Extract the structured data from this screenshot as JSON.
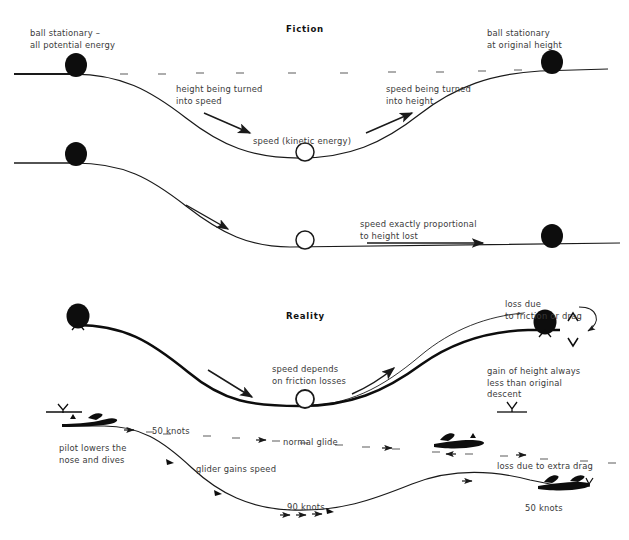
{
  "figure": {
    "type": "diagram"
  },
  "panels": [
    {
      "id": "fiction",
      "title": "Fiction",
      "title_pos": {
        "x": 286,
        "y": 24
      },
      "labels": [
        {
          "name": "ball-stationary-start",
          "text": "ball stationary –\nall potential energy",
          "x": 30,
          "y": 28
        },
        {
          "name": "height-into-speed",
          "text": "height being turned\ninto speed",
          "x": 176,
          "y": 84
        },
        {
          "name": "speed-kinetic-energy",
          "text": "speed (kinetic energy)",
          "x": 253,
          "y": 136
        },
        {
          "name": "speed-into-height",
          "text": "speed being turned\ninto height",
          "x": 386,
          "y": 84
        },
        {
          "name": "ball-stationary-end",
          "text": "ball stationary\nat original height",
          "x": 487,
          "y": 28
        },
        {
          "name": "speed-exactly-proportional",
          "text": "speed exactly proportional\nto height lost",
          "x": 360,
          "y": 219
        }
      ]
    },
    {
      "id": "reality",
      "title": "Reality",
      "title_pos": {
        "x": 286,
        "y": 311
      },
      "labels": [
        {
          "name": "speed-depends-friction",
          "text": "speed depends\non friction losses",
          "x": 272,
          "y": 364
        },
        {
          "name": "loss-due-friction-drag",
          "text": "loss due\nto friction or drag",
          "x": 505,
          "y": 299
        },
        {
          "name": "gain-of-height",
          "text": "gain of height always\nless than original\ndescent",
          "x": 487,
          "y": 366
        },
        {
          "name": "pilot-lowers-nose",
          "text": "pilot lowers the\nnose and dives",
          "x": 59,
          "y": 443
        },
        {
          "name": "glider-gains-speed",
          "text": "glider gains speed",
          "x": 196,
          "y": 464
        },
        {
          "name": "loss-due-extra-drag",
          "text": "loss due to extra drag",
          "x": 497,
          "y": 461
        }
      ],
      "speed_labels": [
        {
          "name": "speed-50-knots-top",
          "text": "50 knots",
          "x": 152,
          "y": 426
        },
        {
          "name": "normal-glide",
          "text": "normal glide",
          "x": 283,
          "y": 437
        },
        {
          "name": "speed-90-knots",
          "text": "90 knots",
          "x": 287,
          "y": 502
        },
        {
          "name": "speed-50-knots-end",
          "text": "50 knots",
          "x": 525,
          "y": 503
        }
      ]
    }
  ],
  "colors": {
    "ink": "#111111",
    "text": "#3a3a3a",
    "line": "#1a1a1a",
    "background": "#ffffff"
  }
}
